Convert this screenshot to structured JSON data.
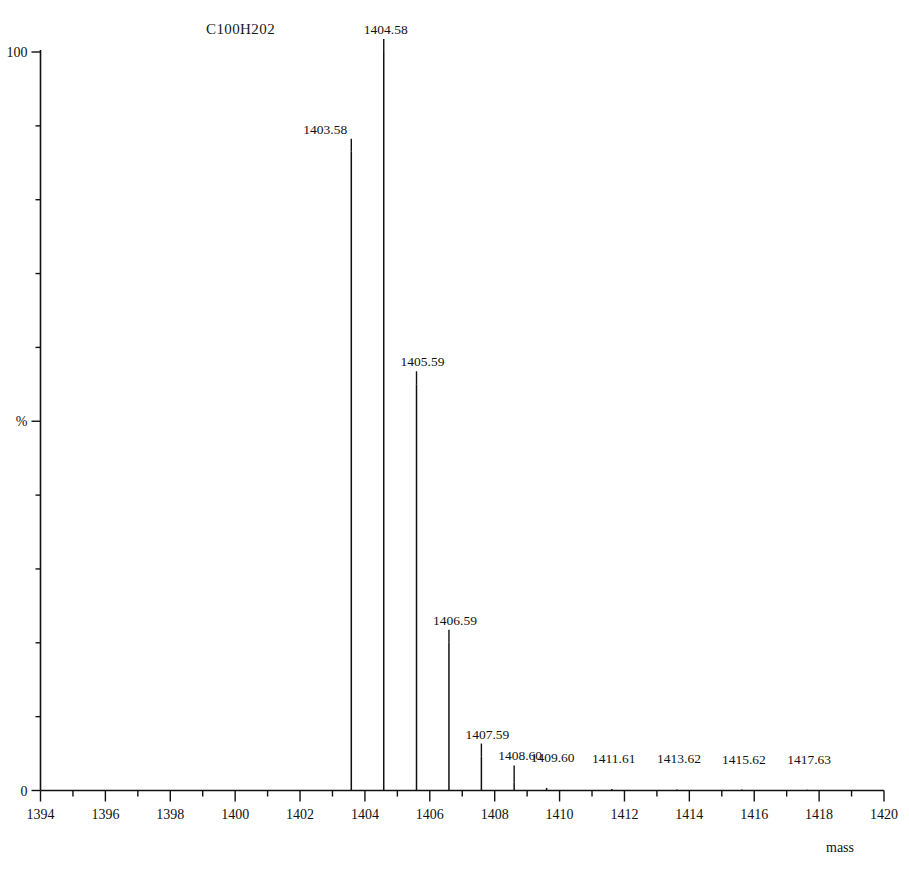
{
  "chart_data": {
    "type": "bar",
    "title": "C100H202",
    "subtitle": "",
    "xlabel": "mass",
    "ylabel": "%",
    "xlim": [
      1394,
      1420
    ],
    "ylim": [
      0,
      100
    ],
    "grid": false,
    "legend": "none",
    "x_tick_labels": [
      "1394",
      "1396",
      "1398",
      "1400",
      "1402",
      "1404",
      "1406",
      "1408",
      "1410",
      "1412",
      "1414",
      "1416",
      "1418",
      "1420"
    ],
    "x_tick_values": [
      1394,
      1396,
      1398,
      1400,
      1402,
      1404,
      1406,
      1408,
      1410,
      1412,
      1414,
      1416,
      1418,
      1420
    ],
    "x_minor_step": 1,
    "y_tick_labels": [
      "100",
      "%",
      "0"
    ],
    "y_tick_values": [
      100,
      50,
      0
    ],
    "y_minor_step": 10,
    "x": [
      1403.58,
      1404.58,
      1405.59,
      1406.59,
      1407.59,
      1408.6,
      1409.6,
      1411.61,
      1413.62,
      1415.62,
      1417.63
    ],
    "values": [
      86.5,
      100.0,
      55.0,
      20.0,
      4.6,
      1.1,
      0.35,
      0.2,
      0.15,
      0.12,
      0.1
    ],
    "data_labels": [
      "1403.58",
      "1404.58",
      "1405.59",
      "1406.59",
      "1407.59",
      "1408.60",
      "1409.60",
      "1411.61",
      "1413.62",
      "1415.62",
      "1417.63"
    ],
    "annotations": []
  },
  "axis": {
    "y_top_label": "100",
    "y_mid_label": "%",
    "y_bottom_label": "0",
    "x_caption": "mass"
  }
}
